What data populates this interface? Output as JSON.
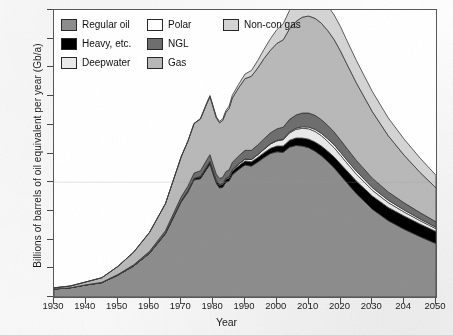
{
  "chart_data": {
    "type": "area",
    "stacked": true,
    "title": "",
    "xlabel": "Year",
    "ylabel": "Billions of barrels of oil equivalent per year (Gb/a)",
    "xlim": [
      1930,
      2050
    ],
    "ylim": [
      0,
      50
    ],
    "xticks": [
      1930,
      1940,
      1950,
      1960,
      1970,
      1980,
      1990,
      2000,
      2010,
      2020,
      2030,
      2040,
      2050
    ],
    "xticklabels": [
      "1930",
      "1940",
      "1950",
      "1960",
      "1970",
      "1980",
      "1990",
      "2000",
      "2010",
      "2020",
      "2030",
      "204",
      "2050"
    ],
    "yticks": [
      0,
      5,
      10,
      15,
      20,
      25,
      30,
      35,
      40,
      45,
      50
    ],
    "grid": "single faint horizontal line at y=20",
    "legend_position": "top-left inside axes",
    "x": [
      1930,
      1935,
      1940,
      1945,
      1950,
      1955,
      1960,
      1965,
      1970,
      1972,
      1974,
      1976,
      1978,
      1979,
      1980,
      1981,
      1982,
      1983,
      1984,
      1985,
      1986,
      1988,
      1990,
      1992,
      1994,
      1996,
      1998,
      2000,
      2002,
      2004,
      2006,
      2008,
      2010,
      2012,
      2014,
      2016,
      2018,
      2020,
      2022,
      2025,
      2030,
      2035,
      2040,
      2045,
      2050
    ],
    "series": [
      {
        "name": "Regular oil",
        "color": "#8e8e8e",
        "values": [
          1.4,
          1.6,
          2.1,
          2.5,
          3.8,
          5.4,
          7.6,
          11.0,
          16.6,
          18.2,
          20.4,
          20.6,
          22.3,
          23.1,
          21.4,
          19.8,
          19.0,
          19.1,
          20.0,
          20.2,
          21.3,
          22.2,
          23.0,
          22.8,
          23.5,
          24.3,
          25.0,
          25.3,
          25.2,
          26.1,
          26.4,
          26.3,
          26.0,
          25.4,
          24.6,
          23.6,
          22.5,
          21.2,
          19.9,
          18.0,
          15.3,
          13.3,
          11.8,
          10.5,
          9.3
        ]
      },
      {
        "name": "Heavy, etc.",
        "color": "#000000",
        "values": [
          0.0,
          0.0,
          0.0,
          0.0,
          0.0,
          0.0,
          0.05,
          0.1,
          0.2,
          0.25,
          0.3,
          0.35,
          0.4,
          0.45,
          0.45,
          0.45,
          0.45,
          0.5,
          0.5,
          0.55,
          0.6,
          0.65,
          0.7,
          0.75,
          0.8,
          0.85,
          0.9,
          1.0,
          1.1,
          1.2,
          1.3,
          1.4,
          1.5,
          1.6,
          1.7,
          1.8,
          1.9,
          2.0,
          2.1,
          2.2,
          2.3,
          2.3,
          2.3,
          2.2,
          2.1
        ]
      },
      {
        "name": "Deepwater",
        "color": "#e9e9e9",
        "values": [
          0.0,
          0.0,
          0.0,
          0.0,
          0.0,
          0.0,
          0.0,
          0.0,
          0.0,
          0.0,
          0.0,
          0.05,
          0.1,
          0.1,
          0.1,
          0.1,
          0.15,
          0.15,
          0.2,
          0.2,
          0.25,
          0.3,
          0.35,
          0.4,
          0.5,
          0.6,
          0.75,
          0.9,
          1.1,
          1.3,
          1.5,
          1.7,
          1.8,
          1.85,
          1.8,
          1.7,
          1.6,
          1.5,
          1.35,
          1.2,
          1.0,
          0.85,
          0.7,
          0.6,
          0.5
        ]
      },
      {
        "name": "Polar",
        "color": "#ffffff",
        "values": [
          0.0,
          0.0,
          0.0,
          0.0,
          0.0,
          0.0,
          0.0,
          0.0,
          0.0,
          0.0,
          0.0,
          0.0,
          0.0,
          0.0,
          0.0,
          0.0,
          0.0,
          0.0,
          0.0,
          0.0,
          0.0,
          0.0,
          0.0,
          0.0,
          0.0,
          0.02,
          0.05,
          0.08,
          0.1,
          0.15,
          0.2,
          0.25,
          0.3,
          0.35,
          0.4,
          0.45,
          0.5,
          0.5,
          0.5,
          0.5,
          0.45,
          0.4,
          0.35,
          0.3,
          0.25
        ]
      },
      {
        "name": "NGL",
        "color": "#6f6f6f",
        "values": [
          0.0,
          0.0,
          0.02,
          0.05,
          0.1,
          0.2,
          0.3,
          0.45,
          0.7,
          0.8,
          0.9,
          1.0,
          1.1,
          1.15,
          1.1,
          1.05,
          1.05,
          1.1,
          1.15,
          1.2,
          1.3,
          1.4,
          1.5,
          1.6,
          1.7,
          1.8,
          1.9,
          2.0,
          2.1,
          2.2,
          2.3,
          2.4,
          2.45,
          2.45,
          2.4,
          2.35,
          2.25,
          2.15,
          2.05,
          1.9,
          1.65,
          1.45,
          1.25,
          1.1,
          0.95
        ]
      },
      {
        "name": "Gas",
        "color": "#b9b9b9",
        "values": [
          0.2,
          0.3,
          0.5,
          0.8,
          1.4,
          2.2,
          3.3,
          4.7,
          7.0,
          7.8,
          8.6,
          9.0,
          9.8,
          10.1,
          10.0,
          9.8,
          9.7,
          9.9,
          10.3,
          10.7,
          11.2,
          11.9,
          12.5,
          12.9,
          13.4,
          14.0,
          14.4,
          14.9,
          15.2,
          15.8,
          16.3,
          16.7,
          16.9,
          16.9,
          16.8,
          16.5,
          16.1,
          15.5,
          14.7,
          13.5,
          11.6,
          9.8,
          8.3,
          7.0,
          5.9
        ]
      },
      {
        "name": "Non-con gas",
        "color": "#d4d4d4",
        "values": [
          0.0,
          0.0,
          0.0,
          0.0,
          0.0,
          0.0,
          0.0,
          0.0,
          0.0,
          0.0,
          0.05,
          0.1,
          0.15,
          0.2,
          0.2,
          0.2,
          0.25,
          0.3,
          0.35,
          0.4,
          0.5,
          0.6,
          0.8,
          1.0,
          1.3,
          1.6,
          2.0,
          2.4,
          2.8,
          3.2,
          3.6,
          3.9,
          4.1,
          4.2,
          4.25,
          4.3,
          4.3,
          4.25,
          4.1,
          3.9,
          3.5,
          3.1,
          2.8,
          2.5,
          2.2
        ]
      }
    ],
    "annotations": [
      "Total peaks near 48.5 Gb/a around 2010",
      "Visible dip 1979-1983 (oil shocks)",
      "Regular oil peaks near 26.4 Gb/a around 2006"
    ]
  },
  "legend": {
    "items": [
      {
        "label": "Regular oil",
        "color": "#8e8e8e"
      },
      {
        "label": "Polar",
        "color": "#ffffff"
      },
      {
        "label": "Non-con gas",
        "color": "#d4d4d4"
      },
      {
        "label": "Heavy, etc.",
        "color": "#000000"
      },
      {
        "label": "NGL",
        "color": "#6f6f6f"
      },
      {
        "label": "Deepwater",
        "color": "#e9e9e9"
      },
      {
        "label": "Gas",
        "color": "#b9b9b9"
      }
    ]
  }
}
